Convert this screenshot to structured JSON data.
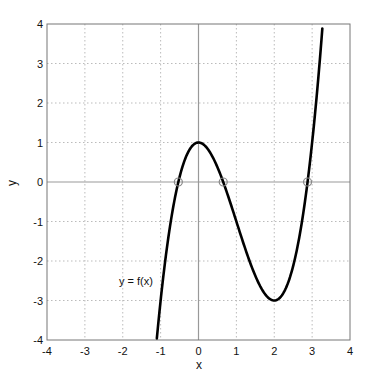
{
  "chart_data": {
    "type": "line",
    "title": "",
    "xlabel": "x",
    "ylabel": "y",
    "xlim": [
      -4,
      4
    ],
    "ylim": [
      -4,
      4
    ],
    "xticks": [
      -4,
      -3,
      -2,
      -1,
      0,
      1,
      2,
      3,
      4
    ],
    "yticks": [
      -4,
      -3,
      -2,
      -1,
      0,
      1,
      2,
      3,
      4
    ],
    "xtick_labels": [
      "-4",
      "-3",
      "-2",
      "-1",
      "0",
      "1",
      "2",
      "3",
      "4"
    ],
    "ytick_labels": [
      "-4",
      "-3",
      "-2",
      "-1",
      "0",
      "1",
      "2",
      "3",
      "4"
    ],
    "grid": true,
    "grid_style": "dotted",
    "zero_lines": true,
    "series": [
      {
        "name": "y = f(x)",
        "function": "x^3 - 3x^2 + 1",
        "color": "#000000",
        "x": [
          -1.1,
          -1.0,
          -0.8,
          -0.6,
          -0.4,
          -0.2,
          0.0,
          0.2,
          0.4,
          0.6,
          0.8,
          1.0,
          1.2,
          1.4,
          1.6,
          1.8,
          2.0,
          2.2,
          2.4,
          2.6,
          2.8,
          3.0,
          3.2,
          3.27
        ],
        "y": [
          -3.96,
          -3.0,
          -1.432,
          -0.296,
          0.456,
          0.872,
          1.0,
          0.888,
          0.584,
          0.136,
          -0.408,
          -1.0,
          -1.592,
          -2.136,
          -2.584,
          -2.888,
          -3.0,
          -2.872,
          -2.456,
          -1.704,
          -0.568,
          1.0,
          2.048,
          4.0
        ]
      }
    ],
    "markers": {
      "name": "roots",
      "shape": "circle",
      "color": "#888888",
      "points": [
        [
          -0.532,
          0
        ],
        [
          0.653,
          0
        ],
        [
          2.879,
          0
        ]
      ]
    },
    "annotations": [
      {
        "text": "y = f(x)",
        "x": -2.1,
        "y": -2.5
      }
    ],
    "legend": null
  }
}
